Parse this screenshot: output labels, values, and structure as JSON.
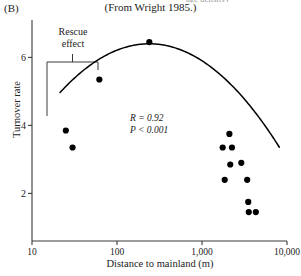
{
  "figure": {
    "panel_label": "(B)",
    "clipped_top_caption": "age density)",
    "source_caption": "(From Wright 1985.)"
  },
  "annotations": {
    "rescue_line1": "Rescue",
    "rescue_line2": "effect",
    "stat_r": "R = 0.92",
    "stat_p": "P < 0.001"
  },
  "colors": {
    "ink": "#1a1a1a",
    "axis": "#3a3a3a",
    "point": "#000000",
    "curve": "#000000",
    "background": "#ffffff"
  },
  "chart_data": {
    "type": "scatter",
    "title": "",
    "subtitle": "(From Wright 1985.)",
    "xlabel": "Distance to mainland (m)",
    "ylabel": "Turnover rate",
    "xscale": "log",
    "yscale": "linear",
    "xlim": [
      10,
      10000
    ],
    "ylim": [
      0.6,
      7.1
    ],
    "xticks": [
      10,
      100,
      1000,
      10000
    ],
    "xticklabels": [
      "10",
      "100",
      "1,000",
      "10,000"
    ],
    "yticks": [
      2,
      4,
      6
    ],
    "yticklabels": [
      "2",
      "4",
      "6"
    ],
    "grid": false,
    "legend": null,
    "points": [
      {
        "x": 25,
        "y": 3.85
      },
      {
        "x": 30,
        "y": 3.35
      },
      {
        "x": 62,
        "y": 5.35
      },
      {
        "x": 240,
        "y": 6.45
      },
      {
        "x": 1750,
        "y": 3.35
      },
      {
        "x": 2100,
        "y": 3.75
      },
      {
        "x": 2250,
        "y": 3.35
      },
      {
        "x": 2150,
        "y": 2.85
      },
      {
        "x": 2900,
        "y": 2.9
      },
      {
        "x": 1850,
        "y": 2.4
      },
      {
        "x": 3400,
        "y": 2.4
      },
      {
        "x": 3500,
        "y": 1.75
      },
      {
        "x": 3550,
        "y": 1.45
      },
      {
        "x": 4300,
        "y": 1.45
      }
    ],
    "fit_curve": {
      "kind": "quadratic-on-log10-x",
      "description": "Hump-shaped fitted curve peaking near 240 m",
      "peak": {
        "x": 240,
        "y": 6.4
      },
      "stat_r": 0.92,
      "stat_p": "<0.001"
    },
    "bracket_annotation": {
      "label": "Rescue effect",
      "x_range": [
        18,
        95
      ],
      "orientation": "down"
    }
  }
}
